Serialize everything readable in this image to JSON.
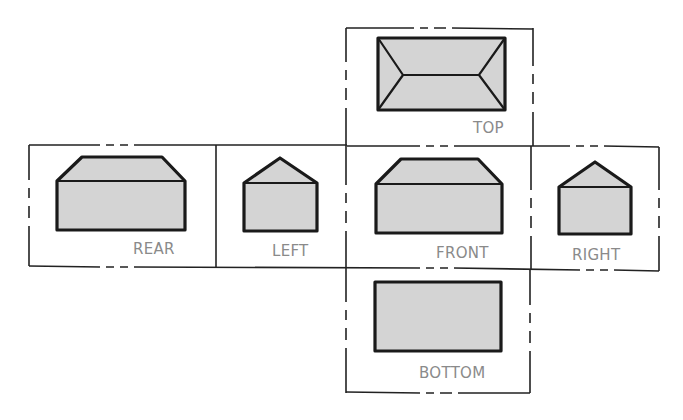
{
  "diagram": {
    "type": "orthographic-projection-unfolded-box",
    "views": [
      {
        "id": "top",
        "label": "TOP"
      },
      {
        "id": "rear",
        "label": "REAR"
      },
      {
        "id": "left",
        "label": "LEFT"
      },
      {
        "id": "front",
        "label": "FRONT"
      },
      {
        "id": "right",
        "label": "RIGHT"
      },
      {
        "id": "bottom",
        "label": "BOTTOM"
      }
    ],
    "colors": {
      "line": "#222222",
      "fill": "#d4d4d4",
      "label": "#8a8a8a",
      "background": "#ffffff"
    }
  }
}
